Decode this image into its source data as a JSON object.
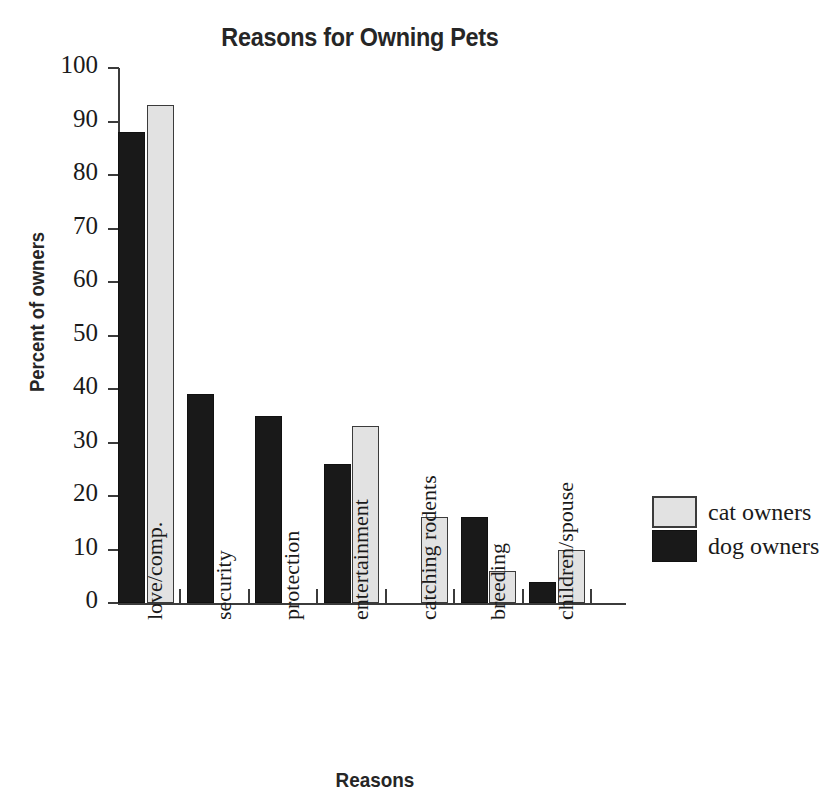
{
  "chart_data": {
    "type": "bar",
    "title": "Reasons for Owning Pets",
    "xlabel": "Reasons",
    "ylabel": "Percent of owners",
    "ylim": [
      0,
      100
    ],
    "yticks": [
      0,
      10,
      20,
      30,
      40,
      50,
      60,
      70,
      80,
      90,
      100
    ],
    "grid": false,
    "legend_position": "right",
    "categories": [
      "love/comp.",
      "security",
      "protection",
      "entertainment",
      "catching rodents",
      "breeding",
      "children/spouse"
    ],
    "series": [
      {
        "name": "dog owners",
        "color": "#191919",
        "values": [
          88,
          39,
          35,
          26,
          null,
          16,
          4
        ]
      },
      {
        "name": "cat owners",
        "color": "#e2e2e2",
        "values": [
          93,
          null,
          null,
          33,
          16,
          6,
          10
        ]
      }
    ],
    "legend": [
      {
        "label": "cat owners",
        "swatch": "cat"
      },
      {
        "label": "dog owners",
        "swatch": "dog"
      }
    ]
  },
  "colors": {
    "cat_fill": "#e2e2e2",
    "dog_fill": "#191919",
    "axis": "#3b3b3b",
    "text": "#1a1a1a"
  }
}
